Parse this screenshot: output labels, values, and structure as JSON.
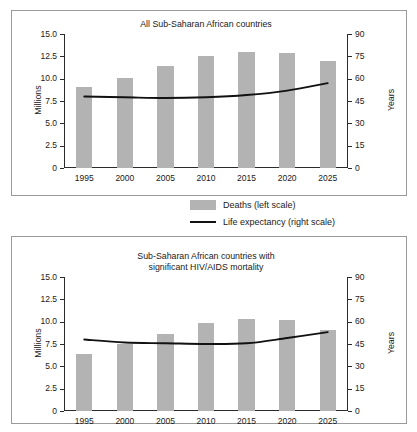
{
  "legend": {
    "deaths_label": "Deaths (left scale)",
    "life_label": "Life expectancy (right scale)"
  },
  "axes": {
    "left_title": "Millions",
    "right_title": "Years",
    "left_ticks": [
      "0",
      "2.5",
      "5.0",
      "7.5",
      "10.0",
      "12.5",
      "15.0"
    ],
    "right_ticks": [
      "0",
      "15",
      "30",
      "45",
      "60",
      "75",
      "90"
    ],
    "x_ticks": [
      "1995",
      "2000",
      "2005",
      "2010",
      "2015",
      "2020",
      "2025"
    ]
  },
  "chart_data": [
    {
      "type": "bar",
      "id": "all-countries",
      "title": "All Sub-Saharan African countries",
      "categories": [
        "1995",
        "2000",
        "2005",
        "2010",
        "2015",
        "2020",
        "2025"
      ],
      "xlabel": "",
      "ylabel": "Millions",
      "y2label": "Years",
      "ylim": [
        0,
        15
      ],
      "y2lim": [
        0,
        90
      ],
      "grid": false,
      "legend_position": "below",
      "series": [
        {
          "name": "Deaths (left scale)",
          "type": "bar",
          "axis": "left",
          "color": "#b3b3b3",
          "values": [
            9.1,
            10.05,
            11.4,
            12.5,
            13.0,
            12.9,
            12.0
          ]
        },
        {
          "name": "Life expectancy (right scale)",
          "type": "line",
          "axis": "right",
          "color": "#111111",
          "values": [
            48,
            47.5,
            47,
            47.5,
            49,
            52,
            57
          ]
        }
      ]
    },
    {
      "type": "bar",
      "id": "hiv-aids-countries",
      "title": "Sub-Saharan African countries with\nsignificant HIV/AIDS mortality",
      "categories": [
        "1995",
        "2000",
        "2005",
        "2010",
        "2015",
        "2020",
        "2025"
      ],
      "xlabel": "",
      "ylabel": "Millions",
      "y2label": "Years",
      "ylim": [
        0,
        15
      ],
      "y2lim": [
        0,
        90
      ],
      "grid": false,
      "legend_position": "above",
      "series": [
        {
          "name": "Deaths (left scale)",
          "type": "bar",
          "axis": "left",
          "color": "#b3b3b3",
          "values": [
            6.4,
            7.45,
            8.6,
            9.85,
            10.25,
            10.15,
            9.05
          ]
        },
        {
          "name": "Life expectancy (right scale)",
          "type": "line",
          "axis": "right",
          "color": "#111111",
          "values": [
            48,
            46,
            45.5,
            45,
            45.5,
            49,
            53
          ]
        }
      ]
    }
  ]
}
